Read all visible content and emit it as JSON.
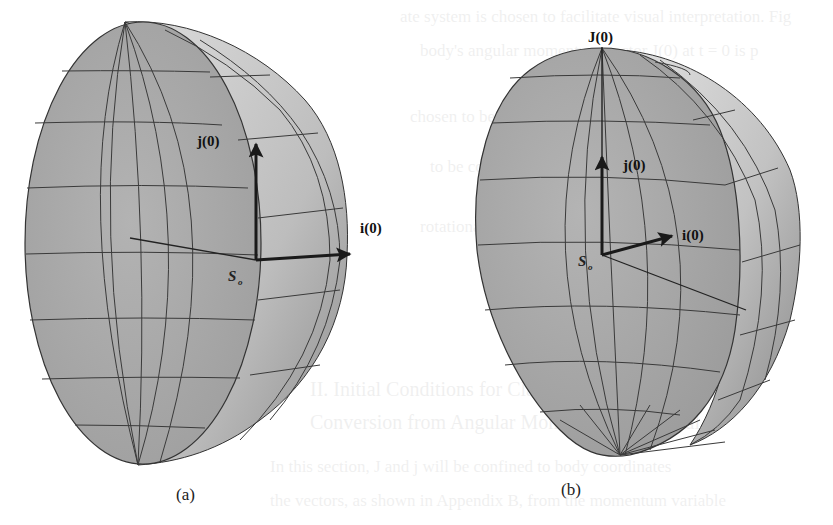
{
  "figure": {
    "panels": [
      {
        "id": "a",
        "caption": "(a)",
        "labels": {
          "j_vector": "j(0)",
          "i_vector": "i(0)",
          "origin_main": "S",
          "origin_sub": "o"
        }
      },
      {
        "id": "b",
        "caption": "(b)",
        "labels": {
          "J_vector": "J(0)",
          "j_vector": "j(0)",
          "i_vector": "i(0)",
          "origin_main": "S",
          "origin_sub": "o"
        }
      }
    ],
    "colors": {
      "surface_front": "#a9a9a9",
      "surface_side": "#c9c9c9",
      "surface_shadow": "#8f8f8f",
      "grid_line": "#3a3a3a",
      "arrow": "#1a1a1a",
      "background": "#ffffff"
    }
  },
  "bleed_through_text": [
    "ate system is chosen to facilitate visual interpretation. Fig",
    "body's angular momentum vector J(0) at t = 0 is p",
    "chosen to be located along the j axis of the b",
    "to be coincident with the principal axes, the in",
    "rotational energy, rather than angular momen",
    "II. Initial Conditions for Classical Poi",
    "Conversion from Angular Momentum Canonical",
    "In this section, J and j will be confined to body coordinates",
    "the vectors, as shown in Appendix B, from the momentum variable"
  ]
}
